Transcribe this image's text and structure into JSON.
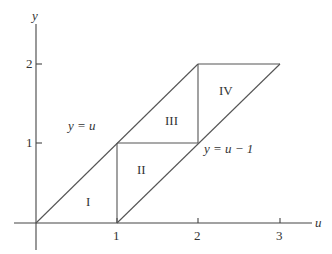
{
  "diagram": {
    "type": "region-decomposition",
    "axes": {
      "x_label": "u",
      "y_label": "y",
      "x_ticks": [
        "1",
        "2",
        "3"
      ],
      "y_ticks": [
        "1",
        "2"
      ]
    },
    "line_labels": {
      "upper": "y = u",
      "lower": "y = u − 1"
    },
    "regions": [
      "I",
      "II",
      "III",
      "IV"
    ],
    "colors": {
      "line": "#555555",
      "text": "#333333",
      "background": "#ffffff"
    }
  }
}
